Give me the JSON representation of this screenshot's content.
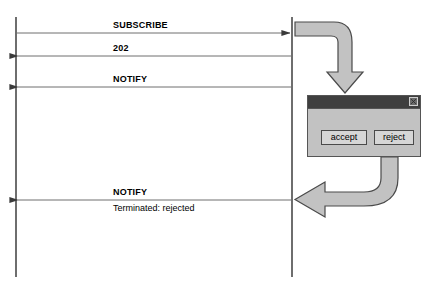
{
  "diagram": {
    "type": "sequence-diagram",
    "canvas": {
      "width": 436,
      "height": 294,
      "background": "#ffffff"
    },
    "colors": {
      "line": "#4a4a4a",
      "arrow_fill": "#c2c2c2",
      "arrow_stroke": "#4a4a4a",
      "dialog_body": "#c2c2c2",
      "dialog_titlebar": "#3f3f3f",
      "button_face": "#d6d6d6",
      "text": "#000000"
    },
    "lifelines": [
      {
        "name": "left-lifeline",
        "x": 16,
        "y_top": 17,
        "y_bottom": 277
      },
      {
        "name": "right-lifeline",
        "x": 292,
        "y_top": 17,
        "y_bottom": 277
      }
    ],
    "messages": [
      {
        "id": "subscribe",
        "label": "SUBSCRIBE",
        "sublabel": "",
        "direction": "right",
        "y": 33,
        "label_x": 113,
        "label_y": 20
      },
      {
        "id": "202",
        "label": "202",
        "sublabel": "",
        "direction": "left",
        "y": 56,
        "label_x": 113,
        "label_y": 43
      },
      {
        "id": "notify-active",
        "label": "NOTIFY",
        "sublabel": "",
        "direction": "left",
        "y": 87,
        "label_x": 113,
        "label_y": 74
      },
      {
        "id": "notify-terminated",
        "label": "NOTIFY",
        "sublabel": "Terminated: rejected",
        "direction": "left",
        "y": 200,
        "label_x": 113,
        "label_y": 187,
        "sublabel_x": 113,
        "sublabel_y": 203
      }
    ],
    "block_arrows": [
      {
        "id": "to-dialog-arrow",
        "name": "curved-arrow-down",
        "from": "right-lifeline",
        "to": "user-dialog",
        "direction": "down"
      },
      {
        "id": "from-dialog-arrow",
        "name": "curved-arrow-left",
        "from": "reject-button",
        "to": "right-lifeline",
        "direction": "left"
      }
    ]
  },
  "dialog": {
    "name": "user-prompt-dialog",
    "x": 307,
    "y": 95,
    "width": 114,
    "height": 62,
    "title": "",
    "close_label": "×",
    "buttons": [
      {
        "id": "accept",
        "label": "accept",
        "x": 13,
        "y": 21,
        "width": 46
      },
      {
        "id": "reject",
        "label": "reject",
        "x": 66,
        "y": 21,
        "width": 40
      }
    ]
  }
}
